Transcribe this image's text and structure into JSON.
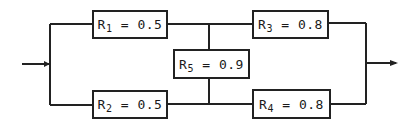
{
  "diagram": {
    "type": "reliability-block-diagram",
    "blocks": [
      {
        "id": "R1",
        "letter": "R",
        "index": "1",
        "value": "0.5",
        "eq": " = 0.5"
      },
      {
        "id": "R2",
        "letter": "R",
        "index": "2",
        "value": "0.5",
        "eq": " = 0.5"
      },
      {
        "id": "R3",
        "letter": "R",
        "index": "3",
        "value": "0.8",
        "eq": " = 0.8"
      },
      {
        "id": "R4",
        "letter": "R",
        "index": "4",
        "value": "0.8",
        "eq": " = 0.8"
      },
      {
        "id": "R5",
        "letter": "R",
        "index": "5",
        "value": "0.9",
        "eq": " = 0.9"
      }
    ],
    "connections": [
      [
        "input",
        "R1"
      ],
      [
        "input",
        "R2"
      ],
      [
        "R1",
        "R3"
      ],
      [
        "R2",
        "R4"
      ],
      [
        "R1-R3 node",
        "R5"
      ],
      [
        "R5",
        "R2-R4 node"
      ],
      [
        "R3",
        "output"
      ],
      [
        "R4",
        "output"
      ]
    ],
    "colors": {
      "line": "#222222",
      "background": "#ffffff"
    }
  }
}
